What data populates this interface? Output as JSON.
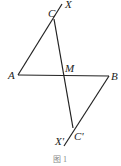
{
  "figure": {
    "points": {
      "A": {
        "label": "A",
        "x": 18,
        "y": 75
      },
      "B": {
        "label": "B",
        "x": 109,
        "y": 76
      },
      "C": {
        "label": "C",
        "x": 54,
        "y": 19
      },
      "M": {
        "label": "M",
        "x": 64,
        "y": 75
      },
      "C_prime": {
        "label": "C'",
        "x": 73,
        "y": 128
      },
      "X": {
        "label": "X",
        "x": 62,
        "y": 4
      },
      "X_prime": {
        "label": "X'",
        "x": 64,
        "y": 146
      }
    },
    "caption": "图 1"
  }
}
